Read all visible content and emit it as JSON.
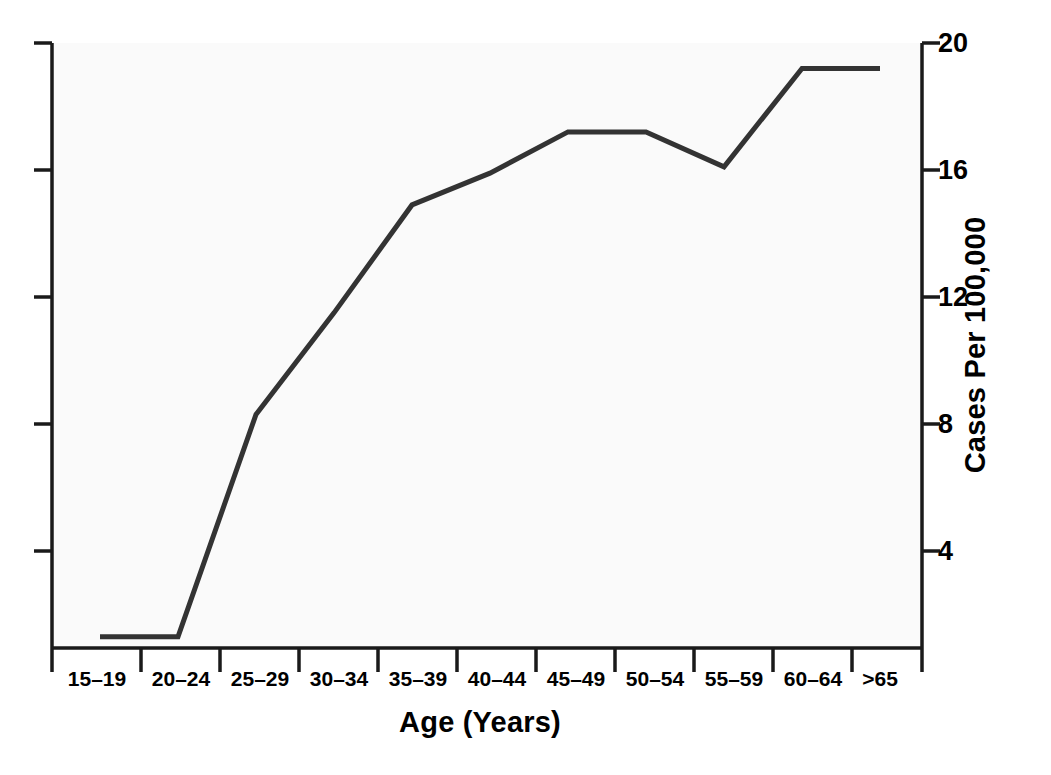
{
  "chart_data": {
    "type": "line",
    "title_visible_fragment": "",
    "xlabel": "Age (Years)",
    "ylabel": "Cases Per 100,000",
    "categories": [
      "15–19",
      "20–24",
      "25–29",
      "30–34",
      "35–39",
      "40–44",
      "45–49",
      "50–54",
      "55–59",
      "60–64",
      ">65"
    ],
    "values": [
      1.3,
      1.3,
      8.3,
      11.5,
      14.9,
      15.9,
      17.2,
      17.2,
      16.1,
      19.2,
      19.2
    ],
    "y_ticks": [
      4,
      8,
      12,
      16,
      20
    ],
    "y_tick_labels": [
      "4",
      "8",
      "12",
      "16",
      "20"
    ],
    "ylim": [
      0.95,
      20.0
    ],
    "y_axis_position": "right",
    "x_axis_position": "bottom",
    "grid": false,
    "legend": false,
    "series_color": "#333333",
    "line_width": 5,
    "plot_background": "#fafafa",
    "axis_color": "#1a1a1a",
    "left_axis_ticks_unlabeled": true
  },
  "axes": {
    "y_tick_labels": [
      "20",
      "16",
      "12",
      "8",
      "4"
    ],
    "y_title": "Cases Per 100,000",
    "x_tick_labels": [
      "15–19",
      "20–24",
      "25–29",
      "30–34",
      "35–39",
      "40–44",
      "45–49",
      "50–54",
      "55–59",
      "60–64",
      ">65"
    ],
    "x_title": "Age (Years)"
  }
}
